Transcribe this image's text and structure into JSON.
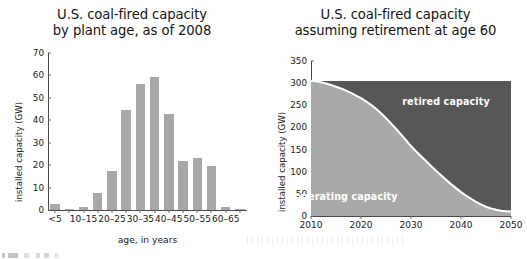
{
  "figure": {
    "caption_fragment": ""
  },
  "chart_data": [
    {
      "id": "coal-capacity-by-plant-age",
      "type": "bar",
      "title": "U.S. coal-fired capacity",
      "subtitle": "by plant age, as of 2008",
      "xlabel": "age, in years",
      "ylabel": "installed capacity (GW)",
      "ylim": [
        0,
        70
      ],
      "yticks": [
        0,
        10,
        20,
        30,
        40,
        50,
        60,
        70
      ],
      "grid": false,
      "legend": "none",
      "bar_color": "#a8a8a8",
      "categories": [
        "<5",
        "5–10",
        "10–15",
        "15–20",
        "20–25",
        "25–30",
        "30–35",
        "35–40",
        "40–45",
        "45–50",
        "50–55",
        "55–60",
        "60–65",
        "65–70"
      ],
      "tick_labels": [
        "<5",
        "",
        "10–15",
        "",
        "20–25",
        "",
        "30–35",
        "",
        "40–45",
        "",
        "50–55",
        "",
        "60–65",
        ""
      ],
      "values": [
        2.5,
        0.5,
        1.5,
        7.5,
        17.5,
        44.5,
        56.0,
        59.5,
        43.0,
        22.0,
        23.0,
        19.5,
        1.5,
        0.3
      ]
    },
    {
      "id": "coal-capacity-retirement-age-60",
      "type": "area",
      "title": "U.S. coal-fired capacity",
      "subtitle": "assuming retirement at age 60",
      "xlabel": "",
      "ylabel": "installed capacity (GW)",
      "ylim": [
        0,
        350
      ],
      "yticks": [
        0,
        50,
        100,
        150,
        200,
        250,
        300,
        350
      ],
      "xlim": [
        2010,
        2050
      ],
      "xticks": [
        2010,
        2020,
        2030,
        2040,
        2050
      ],
      "grid": false,
      "stacked": true,
      "legend": "in-plot labels",
      "colors": {
        "operating": "#a9a9a9",
        "retired": "#575757",
        "boundary": "#ffffff"
      },
      "annotations": [
        {
          "text": "retired capacity",
          "x": 2037,
          "y": 260
        },
        {
          "text": "operating capacity",
          "x": 2017,
          "y": 45
        }
      ],
      "series": [
        {
          "name": "operating capacity",
          "x": [
            2010,
            2011,
            2012,
            2013,
            2014,
            2015,
            2016,
            2017,
            2018,
            2019,
            2020,
            2021,
            2022,
            2023,
            2024,
            2025,
            2026,
            2027,
            2028,
            2029,
            2030,
            2031,
            2032,
            2033,
            2034,
            2035,
            2036,
            2037,
            2038,
            2039,
            2040,
            2041,
            2042,
            2043,
            2044,
            2045,
            2046,
            2047,
            2048,
            2049,
            2050
          ],
          "values": [
            305,
            304,
            302,
            299,
            296,
            292,
            288,
            283,
            278,
            272,
            266,
            259,
            251,
            242,
            232,
            221,
            209,
            197,
            184,
            171,
            158,
            146,
            135,
            124,
            113,
            102,
            92,
            82,
            72,
            63,
            54,
            46,
            39,
            32,
            26,
            21,
            17,
            14,
            12,
            11,
            10
          ]
        },
        {
          "name": "retired capacity",
          "x": [
            2010,
            2011,
            2012,
            2013,
            2014,
            2015,
            2016,
            2017,
            2018,
            2019,
            2020,
            2021,
            2022,
            2023,
            2024,
            2025,
            2026,
            2027,
            2028,
            2029,
            2030,
            2031,
            2032,
            2033,
            2034,
            2035,
            2036,
            2037,
            2038,
            2039,
            2040,
            2041,
            2042,
            2043,
            2044,
            2045,
            2046,
            2047,
            2048,
            2049,
            2050
          ],
          "values": [
            0,
            1,
            3,
            6,
            9,
            13,
            17,
            22,
            27,
            33,
            39,
            46,
            54,
            63,
            73,
            84,
            96,
            108,
            121,
            134,
            147,
            159,
            170,
            181,
            192,
            203,
            213,
            223,
            233,
            242,
            251,
            259,
            266,
            273,
            279,
            284,
            288,
            291,
            293,
            294,
            295
          ]
        }
      ],
      "total": 305
    }
  ]
}
